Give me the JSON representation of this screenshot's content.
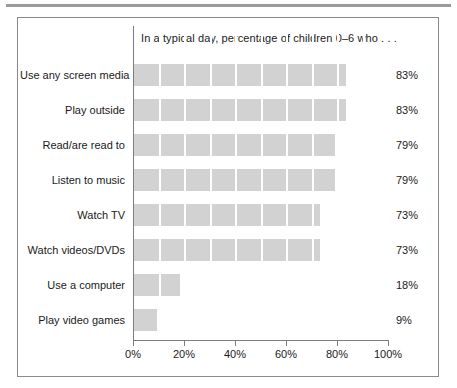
{
  "figure": {
    "title": "In a typical day, percentage of children 0–6 who . . ."
  },
  "axis": {
    "tick_labels": [
      "0%",
      "20%",
      "40%",
      "60%",
      "80%",
      "100%"
    ]
  },
  "colors": {
    "bar_fill": "#d2d2d2",
    "axis_line": "#7d7d7d",
    "frame": "#8a8a8a",
    "top_rule": "#9a9a9a",
    "text": "#1a1a1a",
    "segment_separator": "#ffffff"
  },
  "chart_data": {
    "type": "bar",
    "orientation": "horizontal",
    "title": "In a typical day, percentage of children 0–6 who . . .",
    "xlabel": "",
    "ylabel": "",
    "xlim": [
      0,
      100
    ],
    "xticks": [
      0,
      20,
      40,
      60,
      80,
      100
    ],
    "xtick_labels": [
      "0%",
      "20%",
      "40%",
      "60%",
      "80%",
      "100%"
    ],
    "grid": false,
    "legend": "none",
    "value_suffix": "%",
    "categories": [
      "Use any screen media",
      "Play outside",
      "Read/are read to",
      "Listen to music",
      "Watch TV",
      "Watch videos/DVDs",
      "Use a computer",
      "Play video games"
    ],
    "values": [
      83,
      83,
      79,
      79,
      73,
      73,
      18,
      9
    ],
    "value_labels": [
      "83%",
      "83%",
      "79%",
      "79%",
      "73%",
      "73%",
      "18%",
      "9%"
    ]
  }
}
